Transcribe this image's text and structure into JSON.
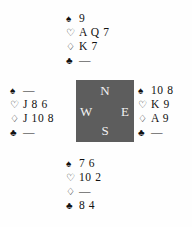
{
  "diagram": {
    "type": "bridge-hand-diagram",
    "background_color": "#fefefe",
    "text_color": "#111111"
  },
  "suits": {
    "spades": {
      "symbol": "♠",
      "name": "spade-icon"
    },
    "hearts": {
      "symbol": "♡",
      "name": "heart-icon"
    },
    "diamonds": {
      "symbol": "♢",
      "name": "diamond-icon"
    },
    "clubs": {
      "symbol": "♣",
      "name": "club-icon"
    }
  },
  "void_marker": "—",
  "compass": {
    "box_color": "#5d5d5d",
    "label_color": "#f2f2f2",
    "north": "N",
    "west": "W",
    "east": "E",
    "south": "S"
  },
  "hands": {
    "north": {
      "position": "North",
      "spades": "9",
      "hearts": "A Q 7",
      "diamonds": "K 7",
      "clubs": "—"
    },
    "west": {
      "position": "West",
      "spades": "—",
      "hearts": "J 8 6",
      "diamonds": "J 10 8",
      "clubs": "—"
    },
    "east": {
      "position": "East",
      "spades": "10 8",
      "hearts": "K 9",
      "diamonds": "A 9",
      "clubs": "—"
    },
    "south": {
      "position": "South",
      "spades": "7 6",
      "hearts": "10 2",
      "diamonds": "—",
      "clubs": "8 4"
    }
  }
}
